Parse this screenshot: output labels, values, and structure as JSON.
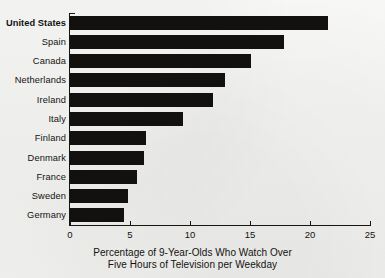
{
  "chart_data": {
    "type": "bar",
    "orientation": "horizontal",
    "title": "",
    "xlabel": "Percentage of 9-Year-Olds Who Watch Over Five Hours of Television per Weekday",
    "xlabel_lines": [
      "Percentage of 9-Year-Olds Who Watch Over",
      "Five Hours of Television per Weekday"
    ],
    "ylabel": "",
    "categories": [
      "United States",
      "Spain",
      "Canada",
      "Netherlands",
      "Ireland",
      "Italy",
      "Finland",
      "Denmark",
      "France",
      "Sweden",
      "Germany"
    ],
    "values": [
      21.5,
      17.8,
      15.1,
      12.9,
      11.9,
      9.4,
      6.3,
      6.2,
      5.6,
      4.8,
      4.5
    ],
    "highlighted_category": "United States",
    "xlim": [
      0,
      25
    ],
    "xticks": [
      0,
      5,
      10,
      15,
      20,
      25
    ],
    "xtick_labels": [
      "0",
      "5",
      "10",
      "15",
      "20",
      "25"
    ],
    "grid": false,
    "legend": false,
    "bar_color": "#121110",
    "background_color": "#f4f4f2",
    "axis_color": "#17150f"
  }
}
